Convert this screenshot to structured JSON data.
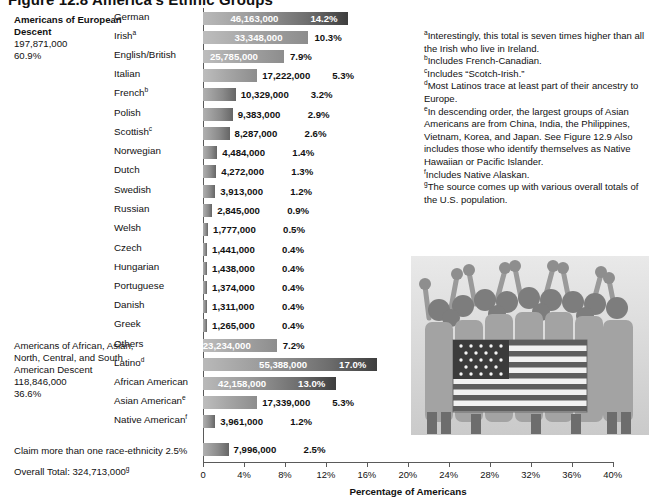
{
  "figure": {
    "title": "Figure 12.8  America's Ethnic Groups"
  },
  "groups": [
    {
      "id": "european",
      "header": "Americans of European Descent",
      "total": "197,871,000",
      "percent": "60.9%"
    },
    {
      "id": "other",
      "header": "Americans of African, Asian, North, Central, and South American Descent",
      "total": "118,846,000",
      "percent": "36.6%"
    }
  ],
  "claim_line": "Claim more than one race-ethnicity 2.5%",
  "overall_total_label": "Overall Total:",
  "overall_total_value": "324,713,000",
  "overall_total_footnote": "g",
  "axis": {
    "title": "Percentage of Americans",
    "ticks": [
      "0",
      "4%",
      "8%",
      "12%",
      "16%",
      "20%",
      "24%",
      "28%",
      "32%",
      "36%",
      "40%"
    ],
    "min": 0,
    "max": 40
  },
  "footnotes": [
    "aInterestingly, this total is seven times higher than all the Irish who live in Ireland.",
    "bIncludes French-Canadian.",
    "cIncludes “Scotch-Irish.”",
    "dMost Latinos trace at least part of their ancestry to Europe.",
    "eIn descending order, the largest groups of Asian Americans are from China, India, the Philippines, Vietnam, Korea, and Japan. See Figure 12.9 Also includes those who identify themselves as Native Hawaiian or Pacific Islander.",
    "fIncludes Native Alaskan.",
    "gThe source comes up with various overall totals of the U.S. population."
  ],
  "photo": {
    "caption": "group-of-people-holding-american-flag"
  },
  "chart_data": {
    "type": "bar",
    "title": "America's Ethnic Groups",
    "xlabel": "Percentage of Americans",
    "ylabel": "",
    "xlim": [
      0,
      40
    ],
    "grid": false,
    "orientation": "horizontal",
    "categories": [
      "German",
      "Irish",
      "English/British",
      "Italian",
      "French",
      "Polish",
      "Scottish",
      "Norwegian",
      "Dutch",
      "Swedish",
      "Russian",
      "Welsh",
      "Czech",
      "Hungarian",
      "Portuguese",
      "Danish",
      "Greek",
      "Others",
      "Latino",
      "African American",
      "Asian American",
      "Native American",
      "Claim more than one race-ethnicity"
    ],
    "values": [
      14.2,
      10.3,
      7.9,
      5.3,
      3.2,
      2.9,
      2.6,
      1.4,
      1.3,
      1.2,
      0.9,
      0.5,
      0.4,
      0.4,
      0.4,
      0.4,
      0.4,
      7.2,
      17.0,
      13.0,
      5.3,
      1.2,
      2.5
    ],
    "counts": [
      "46,163,000",
      "33,348,000",
      "25,785,000",
      "17,222,000",
      "10,329,000",
      "9,383,000",
      "8,287,000",
      "4,484,000",
      "4,272,000",
      "3,913,000",
      "2,845,000",
      "1,777,000",
      "1,441,000",
      "1,438,000",
      "1,374,000",
      "1,311,000",
      "1,265,000",
      "23,234,000",
      "55,388,000",
      "42,158,000",
      "17,339,000",
      "3,961,000",
      "7,996,000"
    ]
  },
  "rows": [
    {
      "label": "German",
      "sup": "",
      "value": "46,163,000",
      "pct": "14.2%",
      "p": 14.2,
      "inside": "both",
      "y": 12
    },
    {
      "label": "Irish",
      "sup": "a",
      "value": "33,348,000",
      "pct": "10.3%",
      "p": 10.3,
      "inside": "value",
      "y": 31
    },
    {
      "label": "English/British",
      "sup": "",
      "value": "25,785,000",
      "pct": "7.9%",
      "p": 7.9,
      "inside": "value",
      "y": 50
    },
    {
      "label": "Italian",
      "sup": "",
      "value": "17,222,000",
      "pct": "5.3%",
      "p": 5.3,
      "inside": "none",
      "y": 69
    },
    {
      "label": "French",
      "sup": "b",
      "value": "10,329,000",
      "pct": "3.2%",
      "p": 3.2,
      "inside": "none",
      "y": 88
    },
    {
      "label": "Polish",
      "sup": "",
      "value": "9,383,000",
      "pct": "2.9%",
      "p": 2.9,
      "inside": "none",
      "y": 108
    },
    {
      "label": "Scottish",
      "sup": "c",
      "value": "8,287,000",
      "pct": "2.6%",
      "p": 2.6,
      "inside": "none",
      "y": 127
    },
    {
      "label": "Norwegian",
      "sup": "",
      "value": "4,484,000",
      "pct": "1.4%",
      "p": 1.4,
      "inside": "none",
      "y": 146
    },
    {
      "label": "Dutch",
      "sup": "",
      "value": "4,272,000",
      "pct": "1.3%",
      "p": 1.3,
      "inside": "none",
      "y": 165
    },
    {
      "label": "Swedish",
      "sup": "",
      "value": "3,913,000",
      "pct": "1.2%",
      "p": 1.2,
      "inside": "none",
      "y": 185
    },
    {
      "label": "Russian",
      "sup": "",
      "value": "2,845,000",
      "pct": "0.9%",
      "p": 0.9,
      "inside": "none",
      "y": 204
    },
    {
      "label": "Welsh",
      "sup": "",
      "value": "1,777,000",
      "pct": "0.5%",
      "p": 0.5,
      "inside": "none",
      "y": 223
    },
    {
      "label": "Czech",
      "sup": "",
      "value": "1,441,000",
      "pct": "0.4%",
      "p": 0.4,
      "inside": "none",
      "y": 243
    },
    {
      "label": "Hungarian",
      "sup": "",
      "value": "1,438,000",
      "pct": "0.4%",
      "p": 0.4,
      "inside": "none",
      "y": 262
    },
    {
      "label": "Portuguese",
      "sup": "",
      "value": "1,374,000",
      "pct": "0.4%",
      "p": 0.4,
      "inside": "none",
      "y": 281
    },
    {
      "label": "Danish",
      "sup": "",
      "value": "1,311,000",
      "pct": "0.4%",
      "p": 0.4,
      "inside": "none",
      "y": 300
    },
    {
      "label": "Greek",
      "sup": "",
      "value": "1,265,000",
      "pct": "0.4%",
      "p": 0.4,
      "inside": "none",
      "y": 319
    },
    {
      "label": "Others",
      "sup": "",
      "value": "23,234,000",
      "pct": "7.2%",
      "p": 7.2,
      "inside": "value",
      "y": 339
    },
    {
      "label": "Latino",
      "sup": "d",
      "value": "55,388,000",
      "pct": "17.0%",
      "p": 17.0,
      "inside": "both",
      "y": 358
    },
    {
      "label": "African American",
      "sup": "",
      "value": "42,158,000",
      "pct": "13.0%",
      "p": 13.0,
      "inside": "both",
      "y": 377
    },
    {
      "label": "Asian American",
      "sup": "e",
      "value": "17,339,000",
      "pct": "5.3%",
      "p": 5.3,
      "inside": "none",
      "y": 396
    },
    {
      "label": "Native American",
      "sup": "f",
      "value": "3,961,000",
      "pct": "1.2%",
      "p": 1.2,
      "inside": "none",
      "y": 415
    },
    {
      "label": "",
      "sup": "",
      "value": "7,996,000",
      "pct": "2.5%",
      "p": 2.5,
      "inside": "none",
      "y": 443
    }
  ]
}
